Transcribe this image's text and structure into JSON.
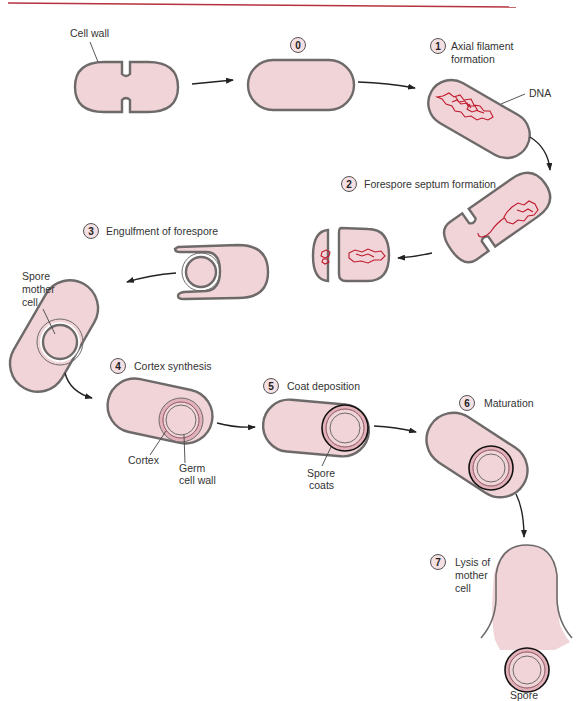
{
  "figure": {
    "header_rule_color": "#b5323e",
    "cell_fill_color": "#f0d4d8",
    "dna_color": "#c0182b",
    "steps": [
      {
        "number": "0",
        "label": ""
      },
      {
        "number": "1",
        "label_line1": "Axial filament",
        "label_line2": "formation"
      },
      {
        "number": "2",
        "label": "Forespore septum formation"
      },
      {
        "number": "3",
        "label": "Engulfment of forespore"
      },
      {
        "number": "4",
        "label": "Cortex synthesis"
      },
      {
        "number": "5",
        "label": "Coat deposition"
      },
      {
        "number": "6",
        "label": "Maturation"
      },
      {
        "number": "7",
        "label_line1": "Lysis of",
        "label_line2": "mother",
        "label_line3": "cell"
      }
    ],
    "callouts": {
      "cell_wall": "Cell wall",
      "dna": "DNA",
      "spore_mother_cell_line1": "Spore",
      "spore_mother_cell_line2": "mother",
      "spore_mother_cell_line3": "cell",
      "cortex": "Cortex",
      "germ_cell_wall_line1": "Germ",
      "germ_cell_wall_line2": "cell wall",
      "spore_coats_line1": "Spore",
      "spore_coats_line2": "coats",
      "spore": "Spore"
    }
  }
}
